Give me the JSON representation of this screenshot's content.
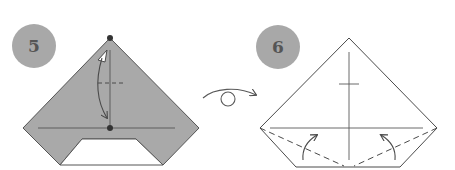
{
  "colors": {
    "paper_colored": "#a9a9a9",
    "paper_white": "#ffffff",
    "line": "#4a4a4a",
    "badge": "#a8a8a8",
    "badge_text": "#555555"
  },
  "steps": [
    {
      "number": "5",
      "description": "Fold the top point down to the marked dot on the horizontal crease",
      "paper_side": "colored"
    },
    {
      "number": "6",
      "description": "Valley-fold the lower corners up along the dashed lines",
      "paper_side": "white"
    }
  ],
  "transition": {
    "symbol": "turn-over-icon",
    "meaning": "Turn the model over"
  }
}
